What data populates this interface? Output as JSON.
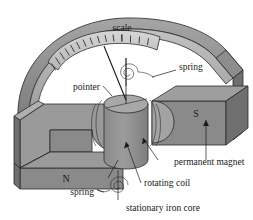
{
  "figure": {
    "width": 253,
    "height": 220,
    "background_color": "#ffffff"
  },
  "labels": {
    "scale": "scale",
    "spring_top": "spring",
    "pointer": "pointer",
    "south_pole": "S",
    "north_pole": "N",
    "permanent_magnet": "permanent magnet",
    "rotating_coil": "rotating coil",
    "spring_bottom": "spring",
    "stationary_iron_core": "stationary iron core"
  },
  "colors": {
    "magnet_top_face": "#9a9a9a",
    "magnet_front_face": "#8a8a8a",
    "magnet_side_face": "#6f6f6f",
    "housing_band": "#8d8d8d",
    "housing_band_light": "#b4b4b4",
    "scale_band": "#c9c9c9",
    "coil_body": "#949494",
    "coil_top": "#a8a8a8",
    "outline": "#2a2a2a",
    "text": "#1a1a1a"
  },
  "scale_detail": {
    "tick_count": 14,
    "band_shape": "curved-arc",
    "major_ticks": 5,
    "minor_ticks": 9
  },
  "components": [
    {
      "name": "scale",
      "kind": "curved graduated arc band"
    },
    {
      "name": "pointer",
      "kind": "needle attached to coil axis"
    },
    {
      "name": "spring",
      "kind": "spiral hairspring",
      "count": 2
    },
    {
      "name": "rotating coil",
      "kind": "cylindrical winding"
    },
    {
      "name": "stationary iron core",
      "kind": "soft iron cylinder"
    },
    {
      "name": "permanent magnet",
      "kind": "U-shaped magnet with N and S poles"
    }
  ]
}
